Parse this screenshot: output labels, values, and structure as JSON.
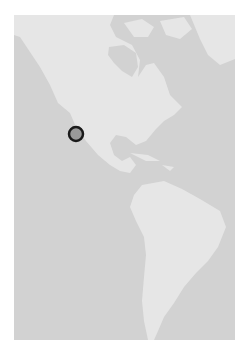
{
  "map": {
    "region": "North and South America",
    "colors": {
      "water": "#d2d2d2",
      "land": "#e6e6e6",
      "marker_fill": "#9a9a9a",
      "marker_stroke": "#1a1a1a"
    },
    "marker": {
      "label": "location-marker",
      "cx": 62,
      "cy": 119,
      "r": 7
    }
  }
}
